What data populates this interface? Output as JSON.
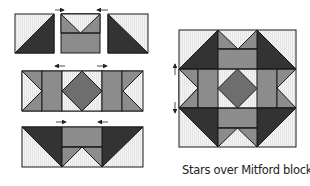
{
  "caption": "Stars over Mitford block",
  "colors": {
    "light": "#f2f2f2",
    "medium": "#8c8c8c",
    "medium_dark": "#6e6e6e",
    "dark": "#333333",
    "line": "#1a1a1a"
  },
  "diagram": {
    "rows": [
      {
        "name": "top-row",
        "units": [
          "half-square-triangle",
          "flying-geese-over-rectangle",
          "half-square-triangle"
        ],
        "pressing_arrows": [
          "left",
          "left"
        ]
      },
      {
        "name": "middle-row",
        "units": [
          "side-triangle-unit",
          "rectangle",
          "square-in-a-square",
          "rectangle",
          "side-triangle-unit"
        ],
        "pressing_arrows": [
          "left",
          "right"
        ]
      },
      {
        "name": "bottom-row",
        "units": [
          "large-triangle",
          "rectangle-over-flying-geese",
          "large-triangle"
        ],
        "pressing_arrows": [
          "right",
          "left"
        ]
      }
    ],
    "block_pressing_arrows": [
      "up",
      "down"
    ]
  }
}
